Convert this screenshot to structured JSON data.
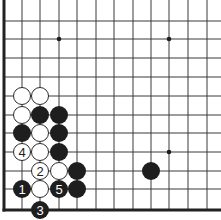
{
  "diagram": {
    "type": "go-board-fragment",
    "edges_shown": [
      "left",
      "bottom"
    ],
    "colors": {
      "background": "#ffffff",
      "line": "#3a3a3a",
      "edge": "#222222",
      "black_stone": "#1e1e1e",
      "white_stone": "#ffffff",
      "white_stone_border": "#2a2a2a",
      "label_on_black": "#ffffff",
      "label_on_white": "#1e1e1e"
    },
    "grid": {
      "columns_x": [
        4,
        22,
        40,
        59,
        77,
        96,
        114,
        133,
        151,
        169,
        188,
        207
      ],
      "rows_y": [
        21,
        39,
        58,
        77,
        96,
        115,
        133,
        152,
        171,
        189,
        210
      ],
      "stone_radius": 9,
      "star_radius": 2.3
    },
    "star_points": [
      {
        "col": 3,
        "row": 1
      },
      {
        "col": 9,
        "row": 1
      },
      {
        "col": 9,
        "row": 7
      }
    ],
    "stones": [
      {
        "col": 1,
        "row": 4,
        "color": "white",
        "label": ""
      },
      {
        "col": 2,
        "row": 4,
        "color": "white",
        "label": ""
      },
      {
        "col": 1,
        "row": 5,
        "color": "white",
        "label": ""
      },
      {
        "col": 2,
        "row": 5,
        "color": "black",
        "label": ""
      },
      {
        "col": 3,
        "row": 5,
        "color": "black",
        "label": ""
      },
      {
        "col": 1,
        "row": 6,
        "color": "black",
        "label": ""
      },
      {
        "col": 2,
        "row": 6,
        "color": "white",
        "label": ""
      },
      {
        "col": 3,
        "row": 6,
        "color": "black",
        "label": ""
      },
      {
        "col": 1,
        "row": 7,
        "color": "white",
        "label": "4"
      },
      {
        "col": 2,
        "row": 7,
        "color": "white",
        "label": ""
      },
      {
        "col": 3,
        "row": 7,
        "color": "black",
        "label": ""
      },
      {
        "col": 2,
        "row": 8,
        "color": "white",
        "label": "2"
      },
      {
        "col": 3,
        "row": 8,
        "color": "white",
        "label": ""
      },
      {
        "col": 4,
        "row": 8,
        "color": "black",
        "label": ""
      },
      {
        "col": 1,
        "row": 9,
        "color": "black",
        "label": "1"
      },
      {
        "col": 2,
        "row": 9,
        "color": "white",
        "label": ""
      },
      {
        "col": 3,
        "row": 9,
        "color": "black",
        "label": "5"
      },
      {
        "col": 4,
        "row": 9,
        "color": "black",
        "label": ""
      },
      {
        "col": 2,
        "row": 10,
        "color": "black",
        "label": "3"
      },
      {
        "col": 8,
        "row": 8,
        "color": "black",
        "label": ""
      }
    ]
  }
}
